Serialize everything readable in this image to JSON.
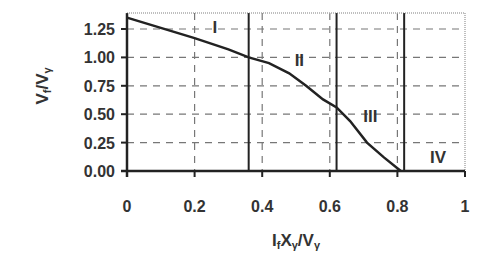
{
  "chart_data": {
    "type": "line",
    "title": "",
    "xlabel": "IfXγ/Vγ",
    "ylabel": "Vf/Vγ",
    "xlabel_parts": {
      "main1": "I",
      "sub1": "f",
      "main2": "X",
      "sub2": "γ",
      "main3": "/V",
      "sub3": "γ"
    },
    "ylabel_parts": {
      "main1": "V",
      "sub1": "f",
      "main2": "/V",
      "sub2": "γ"
    },
    "xlim": [
      0,
      1
    ],
    "ylim": [
      0,
      1.39
    ],
    "x_ticks": [
      "0",
      "0.2",
      "0.4",
      "0.6",
      "0.8",
      "1"
    ],
    "x_tick_values": [
      0,
      0.2,
      0.4,
      0.6,
      0.8,
      1.0
    ],
    "y_ticks": [
      "0.00",
      "0.25",
      "0.50",
      "0.75",
      "1.00",
      "1.25"
    ],
    "y_tick_values": [
      0,
      0.25,
      0.5,
      0.75,
      1.0,
      1.25
    ],
    "grid": {
      "style": "dashed",
      "x": true,
      "y": true
    },
    "legend": null,
    "series": [
      {
        "name": "Vf/Vγ",
        "x": [
          0.0,
          0.1,
          0.2,
          0.3,
          0.36,
          0.42,
          0.48,
          0.53,
          0.58,
          0.62,
          0.66,
          0.71,
          0.76,
          0.81
        ],
        "y": [
          1.35,
          1.26,
          1.17,
          1.07,
          1.0,
          0.95,
          0.86,
          0.75,
          0.63,
          0.56,
          0.44,
          0.25,
          0.12,
          0.0
        ]
      }
    ],
    "region_boundaries": [
      0.36,
      0.62,
      0.82
    ],
    "regions": [
      {
        "label": "I",
        "x": 0.26,
        "y": 1.27
      },
      {
        "label": "II",
        "x": 0.51,
        "y": 0.98
      },
      {
        "label": "III",
        "x": 0.72,
        "y": 0.48
      },
      {
        "label": "IV",
        "x": 0.92,
        "y": 0.12
      }
    ]
  }
}
